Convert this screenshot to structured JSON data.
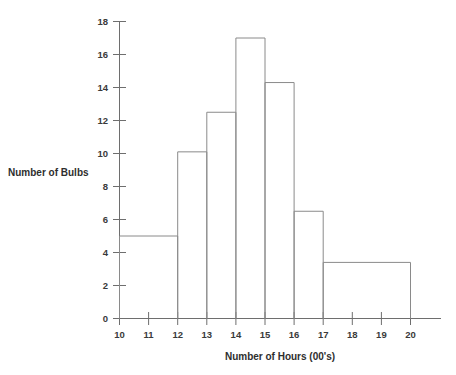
{
  "chart_data": {
    "type": "bar",
    "title": "",
    "xlabel": "Number of Hours (00's)",
    "ylabel": "Number of Bulbs",
    "xlim": [
      10,
      20
    ],
    "ylim": [
      0,
      18
    ],
    "grid": false,
    "legend": null,
    "x_ticks": [
      10,
      11,
      12,
      13,
      14,
      15,
      16,
      17,
      18,
      19,
      20
    ],
    "x_tick_labels": [
      "10",
      "11",
      "12",
      "13",
      "14",
      "15",
      "16",
      "17",
      "18",
      "19",
      "20"
    ],
    "y_ticks": [
      0,
      2,
      4,
      6,
      8,
      10,
      12,
      14,
      16,
      18
    ],
    "y_tick_labels": [
      "0",
      "2",
      "4",
      "6",
      "8",
      "10",
      "12",
      "14",
      "16",
      "18"
    ],
    "bins": [
      {
        "label": "10-12",
        "x_start": 10,
        "x_end": 12,
        "value": 5.0
      },
      {
        "label": "12-13",
        "x_start": 12,
        "x_end": 13,
        "value": 10.1
      },
      {
        "label": "13-14",
        "x_start": 13,
        "x_end": 14,
        "value": 12.5
      },
      {
        "label": "14-15",
        "x_start": 14,
        "x_end": 15,
        "value": 17.0
      },
      {
        "label": "15-16",
        "x_start": 15,
        "x_end": 16,
        "value": 14.3
      },
      {
        "label": "16-17",
        "x_start": 16,
        "x_end": 17,
        "value": 6.5
      },
      {
        "label": "17-20",
        "x_start": 17,
        "x_end": 20,
        "value": 3.4
      }
    ],
    "categories": [
      "10-12",
      "12-13",
      "13-14",
      "14-15",
      "15-16",
      "16-17",
      "17-20"
    ],
    "values": [
      5.0,
      10.1,
      12.5,
      17.0,
      14.3,
      6.5,
      3.4
    ],
    "colors": {
      "background": "#ffffff",
      "axis": "#6e6e6e",
      "bar_outline": "#8a8a8a",
      "bar_fill": "none",
      "text": "#2e2e2e"
    }
  }
}
